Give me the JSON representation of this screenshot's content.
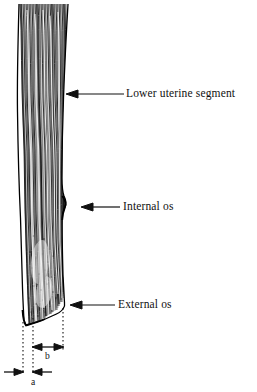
{
  "figure": {
    "width": 257,
    "height": 392,
    "background_color": "#ffffff",
    "ink_color": "#111111",
    "style": "black-and-white engraved line drawing / histological section"
  },
  "callouts": [
    {
      "id": "lower-uterine-segment",
      "label": "Lower uterine segment",
      "arrow_tip": [
        66,
        94
      ],
      "arrow_tail": [
        124,
        94
      ],
      "direction": "left"
    },
    {
      "id": "internal-os",
      "label": "Internal os",
      "arrow_tip": [
        81,
        207
      ],
      "arrow_tail": [
        120,
        207
      ],
      "direction": "left"
    },
    {
      "id": "external-os",
      "label": "External os",
      "arrow_tip": [
        70,
        305
      ],
      "arrow_tail": [
        115,
        305
      ],
      "direction": "left"
    }
  ],
  "measurements": {
    "guide_lines": [
      {
        "id": "guide-left",
        "x": 23,
        "y_top": 322,
        "y_bottom": 374
      },
      {
        "id": "guide-middle",
        "x": 33,
        "y_top": 318,
        "y_bottom": 374
      },
      {
        "id": "guide-right",
        "x": 63,
        "y_top": 308,
        "y_bottom": 350
      }
    ],
    "dimensions": [
      {
        "id": "dim-b",
        "label": "b",
        "type": "double-headed-arrow",
        "y": 347,
        "x_start": 33,
        "x_end": 63,
        "label_position": [
          45,
          352
        ]
      },
      {
        "id": "dim-a",
        "label": "a",
        "type": "inward-facing-arrows",
        "y": 372,
        "x_start": 23,
        "x_end": 33,
        "label_position": [
          31,
          378
        ]
      }
    ]
  },
  "specimen": {
    "id": "cervix-section",
    "description": "Elongated vertical strip of fibrous tissue with dense wavy longitudinal striations, tapering to a pointed inferior tip",
    "left_edge_x_range": [
      17,
      23
    ],
    "right_edge_x_range": [
      62,
      69
    ],
    "y_top": 4,
    "y_bottom": 325
  }
}
